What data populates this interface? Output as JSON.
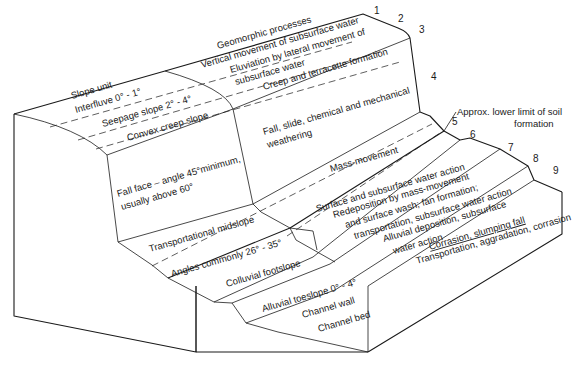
{
  "headers": {
    "slope_unit": "Slope unit",
    "geomorphic_processes": "Geomorphic processes"
  },
  "unit_numbers": [
    "1",
    "2",
    "3",
    "4",
    "5",
    "6",
    "7",
    "8",
    "9"
  ],
  "slope_units": [
    {
      "id": 1,
      "label": "Interfluve  0° - 1°"
    },
    {
      "id": 2,
      "label": "Seepage slope 2° - 4°"
    },
    {
      "id": 3,
      "label": "Convex creep slope"
    },
    {
      "id": 4,
      "label_line1": "Fall face – angle 45°minimum,",
      "label_line2": "usually above 60°"
    },
    {
      "id": 5,
      "label": "Transportational midslope"
    },
    {
      "id": 5,
      "label_extra": "Angles commonly 26° - 35°"
    },
    {
      "id": 6,
      "label": "Colluvial footslope"
    },
    {
      "id": 7,
      "label": "Alluvial toeslope 0° - 4°"
    },
    {
      "id": 8,
      "label": "Channel wall"
    },
    {
      "id": 9,
      "label": "Channel bed"
    }
  ],
  "processes": [
    {
      "id": 1,
      "label": "Vertical movement of subsurface water"
    },
    {
      "id": 2,
      "label_line1": "Eluviation by lateral movement of",
      "label_line2": "subsurface water"
    },
    {
      "id": 3,
      "label": "Creep and terracette formation"
    },
    {
      "id": 4,
      "label_line1": "Fall, slide, chemical and mechanical",
      "label_line2": "weathering"
    },
    {
      "id": 5,
      "label": "Mass-movement"
    },
    {
      "id": 5,
      "label_extra": "Surface and subsurface water action"
    },
    {
      "id": 6,
      "label_line1": "Redeposition by mass-movement",
      "label_line2": "and surface wash; fan formation;",
      "label_line3": "transportation, subsurface water action"
    },
    {
      "id": 7,
      "label_line1": "Alluvial deposition, subsurface",
      "label_line2": "water action"
    },
    {
      "id": 8,
      "label": "Corrasion, slumping fall"
    },
    {
      "id": 9,
      "label": "Transportation, aggradation, corrasion"
    }
  ],
  "annotation": {
    "line1": "Approx. lower limit of soil",
    "line2": "formation"
  }
}
